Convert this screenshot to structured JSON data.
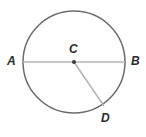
{
  "figure": {
    "kind": "circle-geometry-diagram",
    "background_color": "#ffffff",
    "circle": {
      "name": "circle-C",
      "center_x": 74,
      "center_y": 62,
      "radius": 51,
      "stroke_color": "#6b6b6b",
      "stroke_width": 1.5,
      "fill": "none"
    },
    "segments": [
      {
        "name": "diameter-AB",
        "from": "A",
        "to": "B",
        "x1": 23,
        "y1": 62,
        "x2": 125,
        "y2": 62,
        "stroke_color": "#b4b4b4",
        "stroke_width": 1.5
      },
      {
        "name": "radius-CD",
        "from": "C",
        "to": "D",
        "x1": 74,
        "y1": 62,
        "x2": 104,
        "y2": 106,
        "stroke_color": "#b4b4b4",
        "stroke_width": 1.5
      }
    ],
    "center_dot": {
      "name": "center-point-C",
      "cx": 74,
      "cy": 62,
      "r": 2,
      "fill_color": "#3a3a3a"
    },
    "labels": [
      {
        "id": "A",
        "text": "A",
        "x": 11,
        "y": 62,
        "color": "#2b2b2b"
      },
      {
        "id": "B",
        "text": "B",
        "x": 135,
        "y": 62,
        "color": "#2b2b2b"
      },
      {
        "id": "C",
        "text": "C",
        "x": 74,
        "y": 49,
        "color": "#2b2b2b"
      },
      {
        "id": "D",
        "text": "D",
        "x": 106,
        "y": 118,
        "color": "#2b2b2b"
      }
    ]
  }
}
